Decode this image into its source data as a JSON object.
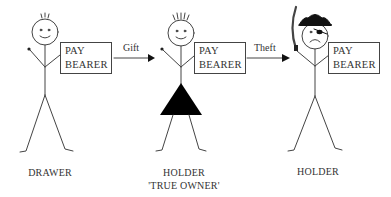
{
  "figures": [
    {
      "id": "drawer",
      "caption_lines": [
        "DRAWER"
      ],
      "cheque": {
        "line1": "PAY",
        "line2": "BEARER"
      },
      "expression": "smile",
      "features": [
        "spiky-hair"
      ]
    },
    {
      "id": "holder-true-owner",
      "caption_lines": [
        "HOLDER",
        "'TRUE OWNER'"
      ],
      "cheque": {
        "line1": "PAY",
        "line2": "BEARER"
      },
      "expression": "smile",
      "features": [
        "spiky-hair",
        "triangle-dress"
      ]
    },
    {
      "id": "holder-thief",
      "caption_lines": [
        "HOLDER"
      ],
      "cheque": {
        "line1": "PAY",
        "line2": "BEARER"
      },
      "expression": "frown",
      "features": [
        "pirate-hat",
        "eye-patch",
        "sword"
      ]
    }
  ],
  "arrows": [
    {
      "from": "drawer",
      "to": "holder-true-owner",
      "label": "Gift"
    },
    {
      "from": "holder-true-owner",
      "to": "holder-thief",
      "label": "Theft"
    }
  ],
  "colors": {
    "ink": "#333333",
    "fill": "#000000",
    "background": "#ffffff"
  }
}
